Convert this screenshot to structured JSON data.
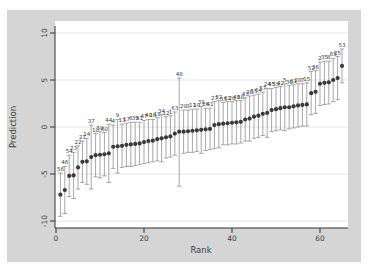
{
  "window": {
    "background": "#ffffff"
  },
  "figure": {
    "panel_color": "#d5d5d5",
    "plot_color": "#ffffff",
    "grid_color": "#e3e3e3",
    "axis_color": "#303030",
    "whisker_color": "#909090",
    "point_color": "#3a3a3a",
    "label_color": "#606060",
    "tick_text_color": "#404040"
  },
  "chart_data": {
    "type": "scatter",
    "subtype": "caterpillar-plot-with-error-bars",
    "title": "",
    "xlabel": "Rank",
    "ylabel": "Prediction",
    "xlim": [
      0,
      66
    ],
    "ylim": [
      -10.7,
      11.3
    ],
    "xticks": [
      0,
      20,
      40,
      60
    ],
    "yticks": [
      10,
      5,
      0,
      -5,
      -10
    ],
    "grid": true,
    "error_bars": true,
    "legend": "none",
    "points": [
      {
        "rank": 1,
        "group": 56,
        "pred": -7.2,
        "lo": -9.5,
        "hi": -4.9
      },
      {
        "rank": 2,
        "group": 46,
        "pred": -6.7,
        "lo": -9.2,
        "hi": -4.2
      },
      {
        "rank": 3,
        "group": 54,
        "pred": -5.2,
        "lo": -7.4,
        "hi": -3.0
      },
      {
        "rank": 4,
        "group": 23,
        "pred": -5.15,
        "lo": -7.6,
        "hi": -2.7
      },
      {
        "rank": 5,
        "group": 22,
        "pred": -4.3,
        "lo": -6.6,
        "hi": -2.0
      },
      {
        "rank": 6,
        "group": 21,
        "pred": -3.7,
        "lo": -5.9,
        "hi": -1.5
      },
      {
        "rank": 7,
        "group": 14,
        "pred": -3.65,
        "lo": -6.1,
        "hi": -1.2
      },
      {
        "rank": 8,
        "group": 37,
        "pred": -3.2,
        "lo": -6.6,
        "hi": 0.2
      },
      {
        "rank": 9,
        "group": 10,
        "pred": -3.0,
        "lo": -5.3,
        "hi": -0.7
      },
      {
        "rank": 10,
        "group": 50,
        "pred": -2.95,
        "lo": -5.4,
        "hi": -0.5
      },
      {
        "rank": 11,
        "group": 60,
        "pred": -2.9,
        "lo": -5.2,
        "hi": -0.6
      },
      {
        "rank": 12,
        "group": 44,
        "pred": -2.8,
        "lo": -5.9,
        "hi": 0.3
      },
      {
        "rank": 13,
        "group": 4,
        "pred": -2.1,
        "lo": -4.4,
        "hi": 0.2
      },
      {
        "rank": 14,
        "group": 9,
        "pred": -2.05,
        "lo": -4.9,
        "hi": 0.8
      },
      {
        "rank": 15,
        "group": 13,
        "pred": -2.0,
        "lo": -4.3,
        "hi": 0.3
      },
      {
        "rank": 16,
        "group": 17,
        "pred": -1.9,
        "lo": -4.2,
        "hi": 0.4
      },
      {
        "rank": 17,
        "group": 6,
        "pred": -1.85,
        "lo": -4.2,
        "hi": 0.5
      },
      {
        "rank": 18,
        "group": 39,
        "pred": -1.8,
        "lo": -4.1,
        "hi": 0.5
      },
      {
        "rank": 19,
        "group": 51,
        "pred": -1.75,
        "lo": -4.0,
        "hi": 0.5
      },
      {
        "rank": 20,
        "group": 47,
        "pred": -1.6,
        "lo": -3.9,
        "hi": 0.7
      },
      {
        "rank": 21,
        "group": 40,
        "pred": -1.5,
        "lo": -3.8,
        "hi": 0.8
      },
      {
        "rank": 22,
        "group": 16,
        "pred": -1.45,
        "lo": -3.7,
        "hi": 0.8
      },
      {
        "rank": 23,
        "group": 18,
        "pred": -1.3,
        "lo": -3.6,
        "hi": 1.0
      },
      {
        "rank": 24,
        "group": 34,
        "pred": -1.2,
        "lo": -3.7,
        "hi": 1.3
      },
      {
        "rank": 25,
        "group": 12,
        "pred": -1.1,
        "lo": -3.3,
        "hi": 1.1
      },
      {
        "rank": 26,
        "group": 1,
        "pred": -1.0,
        "lo": -3.2,
        "hi": 1.2
      },
      {
        "rank": 27,
        "group": 63,
        "pred": -0.7,
        "lo": -3.0,
        "hi": 1.6
      },
      {
        "rank": 28,
        "group": 48,
        "pred": -0.5,
        "lo": -6.3,
        "hi": 5.2
      },
      {
        "rank": 29,
        "group": 29,
        "pred": -0.5,
        "lo": -2.8,
        "hi": 1.8
      },
      {
        "rank": 30,
        "group": 3,
        "pred": -0.45,
        "lo": -2.7,
        "hi": 1.8
      },
      {
        "rank": 31,
        "group": 11,
        "pred": -0.4,
        "lo": -2.7,
        "hi": 1.9
      },
      {
        "rank": 32,
        "group": 19,
        "pred": -0.35,
        "lo": -2.6,
        "hi": 1.9
      },
      {
        "rank": 33,
        "group": 31,
        "pred": -0.3,
        "lo": -2.8,
        "hi": 2.2
      },
      {
        "rank": 34,
        "group": 26,
        "pred": -0.25,
        "lo": -2.5,
        "hi": 2.0
      },
      {
        "rank": 35,
        "group": 41,
        "pred": -0.2,
        "lo": -2.4,
        "hi": 2.0
      },
      {
        "rank": 36,
        "group": 27,
        "pred": 0.2,
        "lo": -2.3,
        "hi": 2.7
      },
      {
        "rank": 37,
        "group": 32,
        "pred": 0.3,
        "lo": -2.2,
        "hi": 2.8
      },
      {
        "rank": 38,
        "group": 33,
        "pred": 0.35,
        "lo": -1.9,
        "hi": 2.6
      },
      {
        "rank": 39,
        "group": 62,
        "pred": 0.4,
        "lo": -1.9,
        "hi": 2.7
      },
      {
        "rank": 40,
        "group": 20,
        "pred": 0.45,
        "lo": -1.8,
        "hi": 2.7
      },
      {
        "rank": 41,
        "group": 49,
        "pred": 0.5,
        "lo": -1.8,
        "hi": 2.8
      },
      {
        "rank": 42,
        "group": 58,
        "pred": 0.55,
        "lo": -1.7,
        "hi": 2.8
      },
      {
        "rank": 43,
        "group": 43,
        "pred": 0.8,
        "lo": -1.5,
        "hi": 3.1
      },
      {
        "rank": 44,
        "group": 38,
        "pred": 0.9,
        "lo": -1.5,
        "hi": 3.3
      },
      {
        "rank": 45,
        "group": 55,
        "pred": 1.1,
        "lo": -1.2,
        "hi": 3.4
      },
      {
        "rank": 46,
        "group": 64,
        "pred": 1.2,
        "lo": -1.1,
        "hi": 3.5
      },
      {
        "rank": 47,
        "group": 57,
        "pred": 1.4,
        "lo": -0.9,
        "hi": 3.7
      },
      {
        "rank": 48,
        "group": 24,
        "pred": 1.5,
        "lo": -1.1,
        "hi": 4.1
      },
      {
        "rank": 49,
        "group": 45,
        "pred": 1.8,
        "lo": -0.5,
        "hi": 4.1
      },
      {
        "rank": 50,
        "group": 59,
        "pred": 1.9,
        "lo": -0.4,
        "hi": 4.2
      },
      {
        "rank": 51,
        "group": 42,
        "pred": 2.0,
        "lo": -0.3,
        "hi": 4.3
      },
      {
        "rank": 52,
        "group": 5,
        "pred": 2.1,
        "lo": -0.4,
        "hi": 4.6
      },
      {
        "rank": 53,
        "group": 30,
        "pred": 2.1,
        "lo": -0.2,
        "hi": 4.4
      },
      {
        "rank": 54,
        "group": 61,
        "pred": 2.2,
        "lo": -0.1,
        "hi": 4.5
      },
      {
        "rank": 55,
        "group": 28,
        "pred": 2.3,
        "lo": 0.0,
        "hi": 4.6
      },
      {
        "rank": 56,
        "group": 7,
        "pred": 2.35,
        "lo": 0.1,
        "hi": 4.6
      },
      {
        "rank": 57,
        "group": 15,
        "pred": 2.4,
        "lo": 0.1,
        "hi": 4.7
      },
      {
        "rank": 58,
        "group": 52,
        "pred": 3.6,
        "lo": 1.3,
        "hi": 5.9
      },
      {
        "rank": 59,
        "group": 36,
        "pred": 3.75,
        "lo": 1.45,
        "hi": 6.0
      },
      {
        "rank": 60,
        "group": 2,
        "pred": 4.6,
        "lo": 2.3,
        "hi": 6.9
      },
      {
        "rank": 61,
        "group": 35,
        "pred": 4.7,
        "lo": 2.4,
        "hi": 7.0
      },
      {
        "rank": 62,
        "group": 8,
        "pred": 4.75,
        "lo": 2.45,
        "hi": 7.0
      },
      {
        "rank": 63,
        "group": 65,
        "pred": 5.0,
        "lo": 2.7,
        "hi": 7.3
      },
      {
        "rank": 64,
        "group": 25,
        "pred": 5.2,
        "lo": 2.9,
        "hi": 7.5
      },
      {
        "rank": 65,
        "group": 53,
        "pred": 6.5,
        "lo": 4.7,
        "hi": 8.3
      }
    ]
  }
}
